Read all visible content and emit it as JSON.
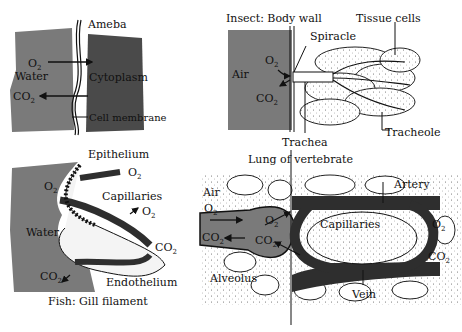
{
  "panels": {
    "ameba": {
      "title": "Ameba",
      "labels": {
        "o2": "O",
        "water": "Water",
        "co2": "CO",
        "cytoplasm": "Cytoplasm",
        "membrane": "Cell membrane"
      }
    },
    "insect": {
      "title": "Insect: Body wall",
      "labels": {
        "spiracle": "Spiracle",
        "tissue": "Tissue cells",
        "air": "Air",
        "o2": "O",
        "co2": "CO",
        "trachea": "Trachea",
        "tracheole": "Tracheole"
      }
    },
    "fish": {
      "title": "Fish: Gill filament",
      "labels": {
        "epithelium": "Epithelium",
        "o2a": "O",
        "o2b": "O",
        "o2c": "O",
        "capillaries": "Capillaries",
        "water": "Water",
        "co2a": "CO",
        "co2b": "CO",
        "endothelium": "Endothelium"
      }
    },
    "lung": {
      "title": "Lung of vertebrate",
      "labels": {
        "air": "Air",
        "o2a": "O",
        "co2a": "CO",
        "o2b": "O",
        "co2b": "CO",
        "alveolus": "Alveolus",
        "artery": "Artery",
        "capillaries": "Capillaries",
        "o2c": "O",
        "co2c": "CO",
        "vein": "Vein"
      }
    }
  },
  "subscript": "2",
  "colors": {
    "water_gray": "#7a7a7a",
    "cytoplasm_dark": "#4a4a4a",
    "vessel_dark": "#2e2e2e",
    "ink": "#111111"
  }
}
